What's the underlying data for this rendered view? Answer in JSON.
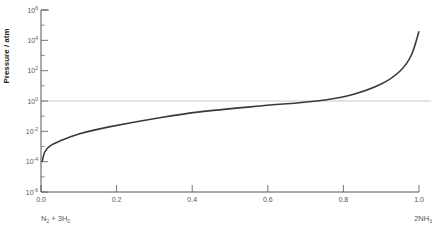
{
  "chart_data": {
    "type": "line",
    "title": "",
    "xlabel": "",
    "ylabel": "Pressure / atm",
    "xlim": [
      0.0,
      1.0
    ],
    "ylim_log10": [
      -6,
      6
    ],
    "yscale": "log",
    "x_ticks": [
      "0.0",
      "0.2",
      "0.4",
      "0.6",
      "0.8",
      "1.0"
    ],
    "x_tick_values": [
      0.0,
      0.2,
      0.4,
      0.6,
      0.8,
      1.0
    ],
    "y_ticks": [
      {
        "base": "10",
        "exp": "6",
        "log": 6
      },
      {
        "base": "10",
        "exp": "4",
        "log": 4
      },
      {
        "base": "10",
        "exp": "2",
        "log": 2
      },
      {
        "base": "10",
        "exp": "0",
        "log": 0
      },
      {
        "base": "10",
        "exp": "-2",
        "log": -2
      },
      {
        "base": "10",
        "exp": "-4",
        "log": -4
      },
      {
        "base": "10",
        "exp": "-6",
        "log": -6
      }
    ],
    "x_end_labels": {
      "left": {
        "text": "N",
        "sub1": "2",
        "mid": " + 3H",
        "sub2": "2"
      },
      "right": {
        "text": "2NH",
        "sub1": "3"
      }
    },
    "reference_line": {
      "log10_pressure": 0,
      "label": "1 atm"
    },
    "grid": false,
    "series": [
      {
        "name": "Equilibrium pressure",
        "x": [
          0.003,
          0.01,
          0.024,
          0.05,
          0.1,
          0.18,
          0.31,
          0.42,
          0.58,
          0.73,
          0.82,
          0.9,
          0.95,
          0.98,
          1.0
        ],
        "log10_y": [
          -4.0,
          -3.36,
          -2.96,
          -2.64,
          -2.17,
          -1.71,
          -1.12,
          -0.72,
          -0.33,
          0.0,
          0.4,
          1.12,
          1.98,
          3.03,
          4.6
        ]
      }
    ]
  },
  "colors": {
    "curve": "#3a3a3a",
    "axis": "#555555",
    "reference_line": "#c8c8c8",
    "text": "#555555"
  }
}
